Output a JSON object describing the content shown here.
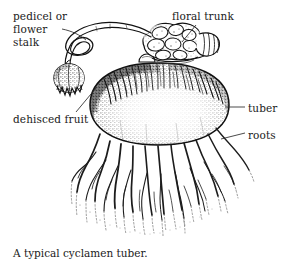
{
  "figure": {
    "caption": "A typical cyclamen tuber.",
    "background_color": "#ffffff",
    "ink_color": "#1a1a1a",
    "labels": [
      {
        "id": "pedicel",
        "text": "pedicel or\nflower\nstalk",
        "position": "top-left",
        "leader": "curve from text to coiled flower stalk"
      },
      {
        "id": "dehisced-fruit",
        "text": "dehisced fruit",
        "position": "mid-left",
        "leader": "diagonal line up to split seed capsule"
      },
      {
        "id": "floral-trunk",
        "text": "floral trunk",
        "position": "top-right",
        "leader": "diagonal line down-left to knobby crown"
      },
      {
        "id": "tuber",
        "text": "tuber",
        "position": "mid-right",
        "leader": "short horizontal dash to tuber body"
      },
      {
        "id": "roots",
        "text": "roots",
        "position": "lower-right",
        "leader": "short diagonal dash to root mass"
      }
    ],
    "parts": [
      "pedicel or flower stalk",
      "dehisced fruit",
      "floral trunk",
      "tuber",
      "roots"
    ]
  }
}
